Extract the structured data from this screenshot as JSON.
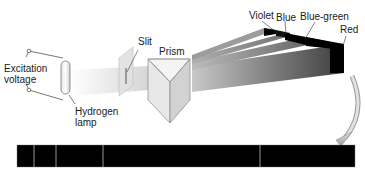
{
  "diagram": {
    "labels": {
      "excitation_line1": "Excitation",
      "excitation_line2": "voltage",
      "lamp_line1": "Hydrogen",
      "lamp_line2": "lamp",
      "slit": "Slit",
      "prism": "Prism",
      "violet": "Violet",
      "blue": "Blue",
      "blue_green": "Blue-green",
      "red": "Red"
    },
    "components": [
      {
        "id": "excitation-voltage",
        "label": "Excitation voltage"
      },
      {
        "id": "hydrogen-lamp",
        "label": "Hydrogen lamp"
      },
      {
        "id": "slit",
        "label": "Slit"
      },
      {
        "id": "prism",
        "label": "Prism"
      },
      {
        "id": "dispersed-beams",
        "items": [
          "Violet",
          "Blue",
          "Blue-green",
          "Red"
        ]
      },
      {
        "id": "line-spectrum",
        "lines": 4
      }
    ],
    "spectrum": {
      "bar_color": "#000000",
      "line_color": "#bdbdbd",
      "line_positions_px": [
        34,
        56,
        103,
        260
      ]
    },
    "colors": {
      "beam_light": "#d6d6d6",
      "beam_dark": "#4a4a4a",
      "arrow": "#b0b0b0",
      "outline": "#555555"
    }
  }
}
